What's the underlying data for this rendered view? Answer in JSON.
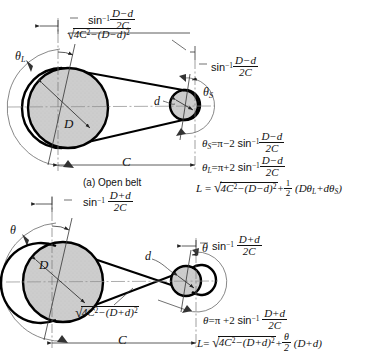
{
  "figure": {
    "title_hidden": "",
    "caption_a": "(a)  Open belt",
    "symbols": {
      "D": "D",
      "d": "d",
      "C": "C",
      "theta_L": "θ",
      "theta_L_sub": "L",
      "theta_S": "θ",
      "theta_S_sub": "S",
      "theta": "θ",
      "pi": "π",
      "arcsin": "sin",
      "arcsin_exp": "−1",
      "two_C": "2C",
      "D_minus_d": "D−d",
      "D_plus_d": "D+d",
      "four_C_sq": "4C",
      "exp_two": "2",
      "half": "1",
      "half_den": "2"
    }
  },
  "panel_open": {
    "name": "(a)  Open belt",
    "angle_large_label": "θ",
    "angle_large_sub": "L",
    "angle_small_label": "θ",
    "angle_small_sub": "S",
    "large_dia_label": "D",
    "small_dia_label": "d",
    "center_dist_label": "C",
    "arcsin_left": {
      "fn": "sin",
      "exp": "−1",
      "num": "D−d",
      "den": "2C"
    },
    "arcsin_right": {
      "fn": "sin",
      "exp": "−1",
      "num": "D−d",
      "den": "2C"
    },
    "span_label": {
      "root_body": "4C²−(D−d)²"
    },
    "equations": [
      {
        "id": "theta-s-eq",
        "text": "θS = π − 2 sin⁻¹ (D−d)/2C"
      },
      {
        "id": "theta-l-eq",
        "text": "θL = π + 2 sin⁻¹ (D−d)/2C"
      },
      {
        "id": "length-eq",
        "text": "L = √(4C²−(D−d)²) + ½ (DθL + dθS)"
      }
    ]
  },
  "panel_crossed": {
    "angle_large_label": "θ",
    "angle_small_label": "θ",
    "large_dia_label": "D",
    "small_dia_label": "d",
    "center_dist_label": "C",
    "arcsin_left": {
      "fn": "sin",
      "exp": "−1",
      "num": "D+d",
      "den": "2C"
    },
    "arcsin_right": {
      "fn": "sin",
      "exp": "−1",
      "num": "D+d",
      "den": "2C"
    },
    "span_label": {
      "root_body": "4C²−(D+d)²"
    },
    "equations": [
      {
        "id": "theta-eq",
        "text": "θ = π + 2 sin⁻¹ (D+d)/2C"
      },
      {
        "id": "length-eq",
        "text": "L = √(4C²−(D+d)²) + (θ/2)(D+d)"
      }
    ]
  },
  "style_colors": {
    "pulley_fill": "#c9c9c9",
    "outline": "#000000",
    "thin_line": "#4a4a4a",
    "center_line": "#7a7a7a",
    "background": "#ffffff"
  },
  "geometry": {
    "open_belt": {
      "large_center": [
        68,
        108
      ],
      "large_radius": 40,
      "small_center": [
        185,
        105
      ],
      "small_radius": 15
    },
    "crossed_belt": {
      "large_center": [
        63,
        282
      ],
      "large_radius": 40,
      "small_center": [
        186,
        281
      ],
      "small_radius": 15
    }
  },
  "letters": {
    "L": "L",
    "equals": "=",
    "plus": "+",
    "minus": "−",
    "times2": "2",
    "paren_open": "(",
    "paren_close": ")"
  }
}
